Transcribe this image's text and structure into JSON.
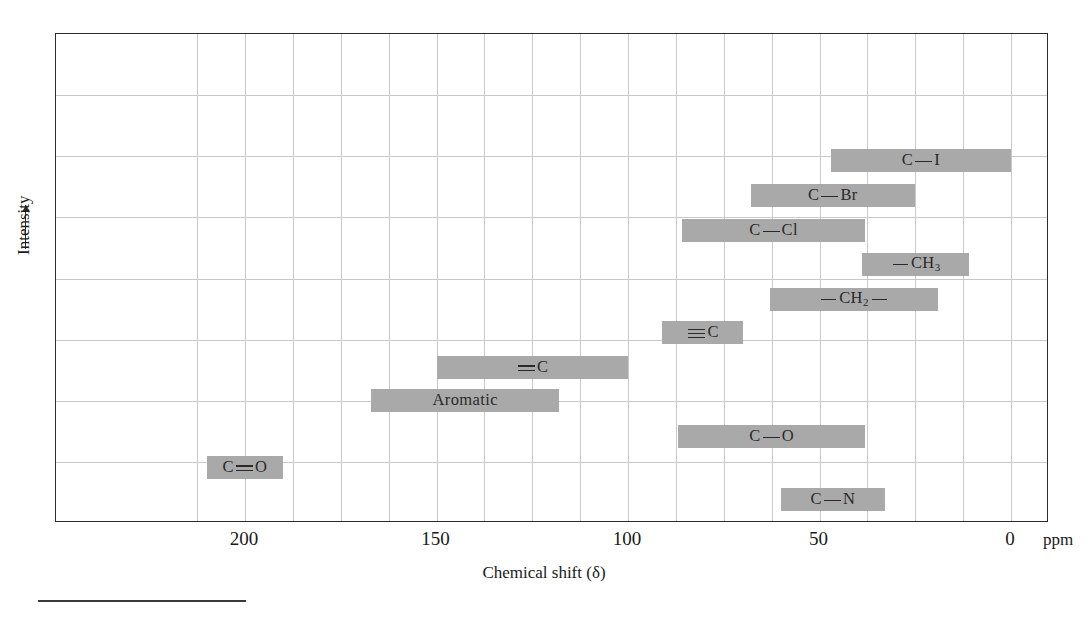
{
  "chart_data": {
    "type": "bar",
    "orientation": "horizontal-ranges",
    "title": "",
    "xlabel": "Chemical shift (δ)",
    "ylabel": "Intensity",
    "xunit": "ppm",
    "xlim": [
      220,
      0
    ],
    "x_reversed": true,
    "xticks": [
      200,
      150,
      100,
      50,
      0
    ],
    "xticklabels": [
      "200",
      "150",
      "100",
      "50",
      "0"
    ],
    "grid": true,
    "legend": null,
    "y_axis_has_ticks": false,
    "bar_color": "#a9a9a9",
    "axis_color": "#2b2b2b",
    "grid_color": "#c9c9c9",
    "categories": [
      "C—I",
      "C—Br",
      "C—Cl",
      "—CH3",
      "—CH2—",
      "≡C",
      "=C",
      "Aromatic",
      "C—O",
      "C—N",
      "C=O"
    ],
    "ranges": [
      {
        "label": "C—I",
        "start_ppm": 47,
        "end_ppm": 0,
        "row": 0
      },
      {
        "label": "C—Br",
        "start_ppm": 68,
        "end_ppm": 25,
        "row": 1
      },
      {
        "label": "C—Cl",
        "start_ppm": 86,
        "end_ppm": 38,
        "row": 2
      },
      {
        "label": "—CH3",
        "start_ppm": 39,
        "end_ppm": 11,
        "row": 3
      },
      {
        "label": "—CH2—",
        "start_ppm": 63,
        "end_ppm": 19,
        "row": 4
      },
      {
        "label": "≡C",
        "start_ppm": 91,
        "end_ppm": 70,
        "row": 5
      },
      {
        "label": "=C",
        "start_ppm": 150,
        "end_ppm": 100,
        "row": 6
      },
      {
        "label": "Aromatic",
        "start_ppm": 167,
        "end_ppm": 118,
        "row": 7
      },
      {
        "label": "C—O",
        "start_ppm": 87,
        "end_ppm": 38,
        "row": 8
      },
      {
        "label": "C—N",
        "start_ppm": 60,
        "end_ppm": 33,
        "row": 9
      },
      {
        "label": "C=O",
        "start_ppm": 210,
        "end_ppm": 190,
        "row": 10
      }
    ]
  },
  "axes": {
    "x_title": "Chemical shift (δ)",
    "y_title": "Intensity",
    "unit_label": "ppm",
    "ticks": [
      {
        "value": 200,
        "label": "200"
      },
      {
        "value": 150,
        "label": "150"
      },
      {
        "value": 100,
        "label": "100"
      },
      {
        "value": 50,
        "label": "50"
      },
      {
        "value": 0,
        "label": "0"
      }
    ]
  },
  "bars": [
    {
      "name": "c-iodine",
      "text": "C",
      "glyph": "single",
      "tail": "I",
      "sub": ""
    },
    {
      "name": "c-bromine",
      "text": "C",
      "glyph": "single",
      "tail": "Br",
      "sub": ""
    },
    {
      "name": "c-chlorine",
      "text": "C",
      "glyph": "single",
      "tail": "Cl",
      "sub": ""
    },
    {
      "name": "methyl",
      "text": "",
      "glyph": "dash",
      "tail": "CH",
      "sub": "3"
    },
    {
      "name": "methylene",
      "text": "",
      "glyph": "dash",
      "tail": "CH",
      "sub": "2"
    },
    {
      "name": "alkyne",
      "text": "",
      "glyph": "triple",
      "tail": "C",
      "sub": ""
    },
    {
      "name": "alkene",
      "text": "",
      "glyph": "double",
      "tail": "C",
      "sub": ""
    },
    {
      "name": "aromatic",
      "text": "Aromatic",
      "glyph": "none",
      "tail": "",
      "sub": ""
    },
    {
      "name": "c-oxygen",
      "text": "C",
      "glyph": "single",
      "tail": "O",
      "sub": ""
    },
    {
      "name": "c-nitrogen",
      "text": "C",
      "glyph": "single",
      "tail": "N",
      "sub": ""
    },
    {
      "name": "carbonyl",
      "text": "C",
      "glyph": "double",
      "tail": "O",
      "sub": ""
    }
  ]
}
